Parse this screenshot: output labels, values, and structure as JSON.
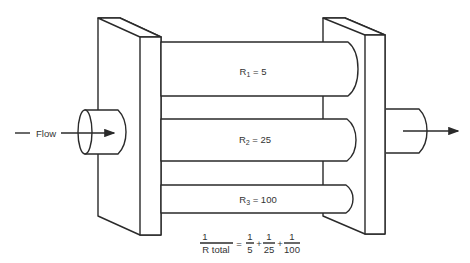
{
  "diagram": {
    "flow_label": "Flow",
    "resistors": [
      {
        "symbol": "R",
        "subscript": "1",
        "value": "5",
        "label_suffix": " = 5"
      },
      {
        "symbol": "R",
        "subscript": "2",
        "value": "25",
        "label_suffix": " = 25"
      },
      {
        "symbol": "R",
        "subscript": "3",
        "value": "100",
        "label_suffix": " = 100"
      }
    ],
    "formula": {
      "lhs_numerator": "1",
      "lhs_denominator": "R total",
      "equals": "=",
      "plus": "+",
      "terms": [
        {
          "numerator": "1",
          "denominator": "5"
        },
        {
          "numerator": "1",
          "denominator": "25"
        },
        {
          "numerator": "1",
          "denominator": "100"
        }
      ]
    },
    "colors": {
      "stroke": "#2a2a2a",
      "text": "#333333",
      "background": "#ffffff"
    }
  }
}
